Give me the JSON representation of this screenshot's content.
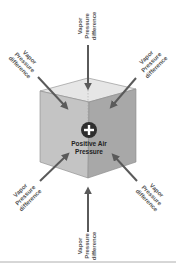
{
  "diagram": {
    "center": {
      "symbol": "+",
      "label_line1": "Positive Air",
      "label_line2": "Pressure"
    },
    "arrows": [
      {
        "id": "top",
        "direction": "inward",
        "lines": [
          "Vapor",
          "Pressure",
          "difference"
        ]
      },
      {
        "id": "top-left",
        "direction": "inward",
        "lines": [
          "Vapor",
          "Pressure",
          "difference"
        ]
      },
      {
        "id": "top-right",
        "direction": "inward",
        "lines": [
          "Vapor",
          "Pressure",
          "difference"
        ]
      },
      {
        "id": "bottom-left",
        "direction": "inward",
        "lines": [
          "Vapor",
          "Pressure",
          "difference"
        ]
      },
      {
        "id": "bottom-right",
        "direction": "inward",
        "lines": [
          "Vapor",
          "Pressure",
          "difference"
        ]
      },
      {
        "id": "bottom",
        "direction": "inward",
        "lines": [
          "Vapor",
          "Pressure",
          "difference"
        ]
      }
    ],
    "colors": {
      "arrow": "#5a5a5a",
      "face_left": "#c4c4c4",
      "face_right": "#a8a8a8",
      "face_top": "#e6e6e6",
      "plus_circle": "#2e2e2e",
      "divider": "#9a9a9a"
    }
  }
}
